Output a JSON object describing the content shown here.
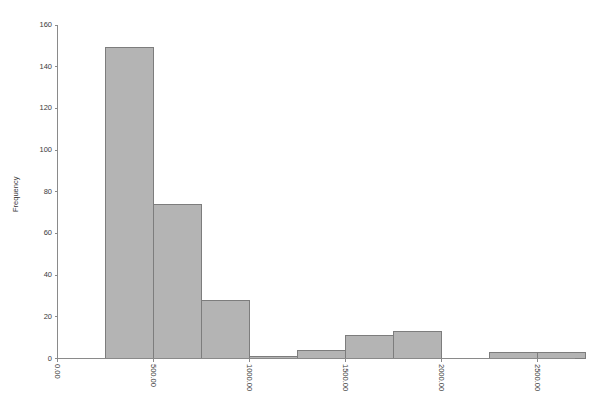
{
  "chart": {
    "title": "",
    "background_color": "#ffffff",
    "bar_fill_color": "#b4b4b4",
    "bar_edge_color": "#7d7d7d",
    "axis_color": "#8a8a8a",
    "text_color": "#3a3a3a"
  },
  "chart_data": {
    "type": "bar",
    "title": "",
    "xlabel": "",
    "ylabel": "Frequency",
    "xlim": [
      0,
      2500
    ],
    "ylim": [
      0,
      160
    ],
    "grid": false,
    "legend": null,
    "bin_width": 250,
    "categories": [
      "0.00-250.00",
      "250.00-500.00",
      "500.00-750.00",
      "750.00-1000.00",
      "1000.00-1250.00",
      "1250.00-1500.00",
      "1500.00-1750.00",
      "1750.00-2000.00",
      "2000.00-2250.00",
      "2250.00-2500.00",
      "2500.00-2750.00"
    ],
    "bins": [
      {
        "start": 0,
        "end": 250,
        "value": 0
      },
      {
        "start": 250,
        "end": 500,
        "value": 149
      },
      {
        "start": 500,
        "end": 750,
        "value": 74
      },
      {
        "start": 750,
        "end": 1000,
        "value": 28
      },
      {
        "start": 1000,
        "end": 1250,
        "value": 1
      },
      {
        "start": 1250,
        "end": 1500,
        "value": 4
      },
      {
        "start": 1500,
        "end": 1750,
        "value": 11
      },
      {
        "start": 1750,
        "end": 2000,
        "value": 13
      },
      {
        "start": 2000,
        "end": 2250,
        "value": 0
      },
      {
        "start": 2250,
        "end": 2500,
        "value": 3
      },
      {
        "start": 2500,
        "end": 2750,
        "value": 3
      }
    ],
    "values": [
      0,
      149,
      74,
      28,
      1,
      4,
      11,
      13,
      0,
      3,
      3
    ],
    "x_ticks": [
      {
        "value": 0,
        "label": "0.00"
      },
      {
        "value": 500,
        "label": "500.00"
      },
      {
        "value": 1000,
        "label": "1000.00"
      },
      {
        "value": 1500,
        "label": "1500.00"
      },
      {
        "value": 2000,
        "label": "2000.00"
      },
      {
        "value": 2500,
        "label": "2500.00"
      }
    ],
    "y_ticks": [
      {
        "value": 0,
        "label": "0"
      },
      {
        "value": 20,
        "label": "20"
      },
      {
        "value": 40,
        "label": "40"
      },
      {
        "value": 60,
        "label": "60"
      },
      {
        "value": 80,
        "label": "80"
      },
      {
        "value": 100,
        "label": "100"
      },
      {
        "value": 120,
        "label": "120"
      },
      {
        "value": 140,
        "label": "140"
      },
      {
        "value": 160,
        "label": "160"
      }
    ]
  }
}
